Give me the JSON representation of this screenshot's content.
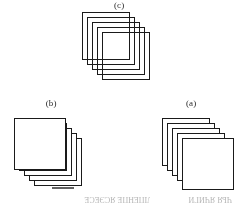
{
  "figure": {
    "background_color": "#ffffff",
    "ink_color": "#1a1a1a",
    "orientation_note": "upside-down",
    "panels": [
      {
        "id": "c",
        "label": "(c)",
        "label_rendered": "(ɔ)",
        "position": "top-center",
        "card_count": 5,
        "card_fill": "transparent",
        "front_card": "bottom-right",
        "offset_direction": "down-right"
      },
      {
        "id": "b",
        "label": "(b)",
        "label_rendered": "(q)",
        "position": "bottom-left",
        "card_count": 5,
        "card_fill": "white",
        "front_card": "top-left",
        "offset_direction": "down-right"
      },
      {
        "id": "a",
        "label": "(a)",
        "label_rendered": "(ɐ)",
        "position": "bottom-right",
        "card_count": 5,
        "card_fill": "white",
        "front_card": "bottom-right",
        "offset_direction": "down-right"
      }
    ]
  },
  "bleed": {
    "line_1": "ЛПЕНПЕ ЯСЭЕСЕ",
    "line_2": "ЧЬЯ ЯЧИГИ"
  }
}
